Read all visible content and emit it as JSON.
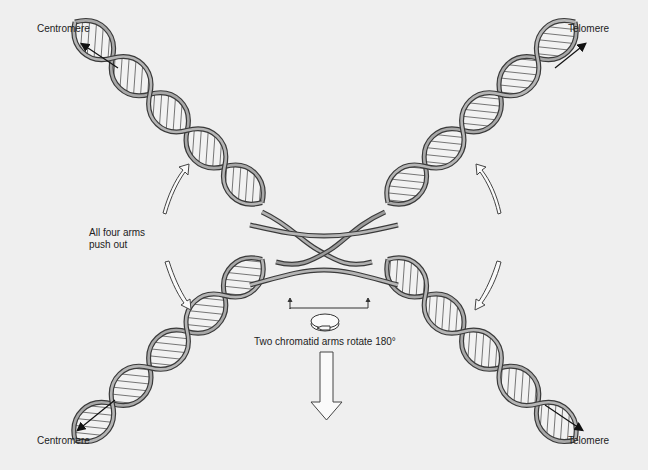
{
  "diagram": {
    "title": "",
    "labels": {
      "top_left": "Centromere",
      "top_right": "Telomere",
      "bottom_left": "Centromere",
      "bottom_right": "Telomere",
      "push_line1": "All four arms",
      "push_line2": "push out",
      "rotate": "Two chromatid arms rotate 180°"
    },
    "colors": {
      "background": "#efefef",
      "strand": "#8a8a8a",
      "strand_dark": "#3a3a3a",
      "rungs": "#555555",
      "text": "#222222"
    },
    "elements": [
      {
        "id": "helix-upper-left",
        "from": "Centromere (top-left)",
        "to": "center crossover"
      },
      {
        "id": "helix-upper-right",
        "from": "Telomere (top-right)",
        "to": "center crossover"
      },
      {
        "id": "helix-lower-left",
        "from": "Centromere (bottom-left)",
        "to": "center crossover"
      },
      {
        "id": "helix-lower-right",
        "from": "Telomere (bottom-right)",
        "to": "center crossover"
      },
      {
        "id": "push-arrows",
        "count": 4,
        "meaning": "All four arms push out"
      },
      {
        "id": "rotate-indicator",
        "meaning": "Two chromatid arms rotate 180°"
      },
      {
        "id": "down-arrow",
        "meaning": "next step"
      }
    ]
  }
}
